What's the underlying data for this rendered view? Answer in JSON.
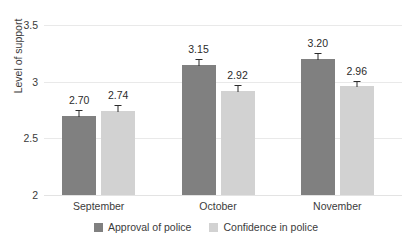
{
  "chart_data": {
    "type": "bar",
    "title": "",
    "xlabel": "",
    "ylabel": "Level of support",
    "ylim": [
      2,
      3.5
    ],
    "yticks": [
      2,
      2.5,
      3,
      3.5
    ],
    "ytick_labels": [
      "2",
      "2.5",
      "3",
      "3.5"
    ],
    "grid": true,
    "legend_position": "bottom-center",
    "categories": [
      "September",
      "October",
      "November"
    ],
    "series": [
      {
        "name": "Approval of police",
        "color": "#808080",
        "values": [
          2.7,
          3.15,
          3.2
        ],
        "value_labels": [
          "2.70",
          "3.15",
          "3.20"
        ],
        "error_bars": [
          0.05,
          0.05,
          0.05
        ]
      },
      {
        "name": "Confidence in police",
        "color": "#d2d2d2",
        "values": [
          2.74,
          2.92,
          2.96
        ],
        "value_labels": [
          "2.74",
          "2.92",
          "2.96"
        ],
        "error_bars": [
          0.05,
          0.05,
          0.05
        ]
      }
    ]
  },
  "axis": {
    "y_title": "Level of support",
    "ticks": [
      {
        "label": "3.5",
        "value": 3.5
      },
      {
        "label": "3",
        "value": 3
      },
      {
        "label": "2.5",
        "value": 2.5
      },
      {
        "label": "2",
        "value": 2
      }
    ]
  },
  "legend": {
    "items": [
      {
        "label": "Approval of police",
        "color": "#808080"
      },
      {
        "label": "Confidence in police",
        "color": "#d2d2d2"
      }
    ]
  },
  "colors": {
    "series_a": "#808080",
    "series_b": "#d2d2d2",
    "gridline": "#e9e9e9",
    "text": "#3b3b3b",
    "background": "#ffffff"
  }
}
